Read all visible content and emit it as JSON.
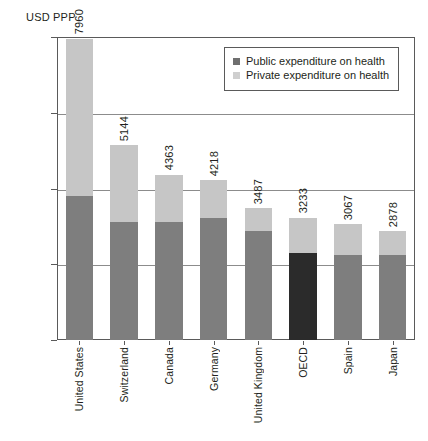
{
  "chart_data": {
    "type": "bar",
    "subtype": "stacked-vertical",
    "title": "",
    "axis_unit_label": "USD PPP",
    "xlabel": "",
    "ylabel": "USD PPP",
    "ylim": [
      0,
      8000
    ],
    "yticks": [
      0,
      2000,
      4000,
      6000,
      8000
    ],
    "ytick_labels": [
      "0",
      "2000",
      "4000",
      "6000",
      "8000"
    ],
    "grid": "horizontal",
    "legend_position": "top-right-inside",
    "categories": [
      "United States",
      "Switzerland",
      "Canada",
      "Germany",
      "United Kingdom",
      "OECD",
      "Spain",
      "Japan"
    ],
    "series": [
      {
        "name": "Public expenditure on health",
        "color": "#7e7e7e",
        "values": [
          3800,
          3110,
          3110,
          3220,
          2880,
          2300,
          2240,
          2250
        ]
      },
      {
        "name": "Private expenditure on health",
        "color": "#c6c6c6",
        "values": [
          4160,
          2034,
          1253,
          998,
          607,
          933,
          827,
          628
        ]
      }
    ],
    "totals": [
      7960,
      5144,
      4363,
      4218,
      3487,
      3233,
      3067,
      2878
    ],
    "total_labels": [
      "7960",
      "5144",
      "4363",
      "4218",
      "3487",
      "3233",
      "3067",
      "2878"
    ],
    "highlighted_category": "OECD",
    "highlight_color": "#2b2b2b"
  },
  "legend": {
    "items": [
      {
        "label": "Public expenditure on health",
        "swatch": "public"
      },
      {
        "label": "Private expenditure on health",
        "swatch": "private"
      }
    ]
  }
}
